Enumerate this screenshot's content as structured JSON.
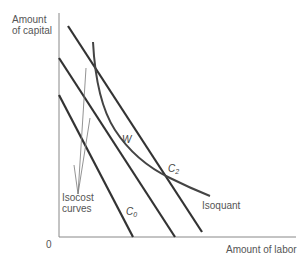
{
  "diagram": {
    "y_axis_label_line1": "Amount",
    "y_axis_label_line2": "of capital",
    "x_axis_label": "Amount of labor",
    "origin_label": "0",
    "isocost_label_line1": "Isocost",
    "isocost_label_line2": "curves",
    "isoquant_label": "Isoquant",
    "tangent_point_label": "W",
    "c0_label": "C",
    "c0_sub": "0",
    "c2_label": "C",
    "c2_sub": "2",
    "colors": {
      "lines": "#333333",
      "axes": "#777777",
      "text": "#555555"
    }
  }
}
